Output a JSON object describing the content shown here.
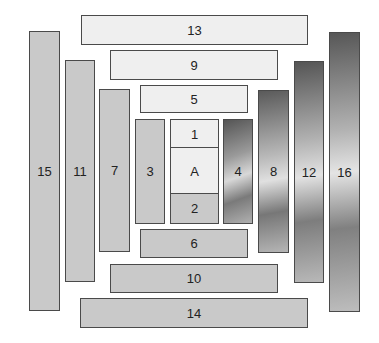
{
  "diagram": {
    "boxes": [
      {
        "id": "13",
        "label": "13"
      },
      {
        "id": "9",
        "label": "9"
      },
      {
        "id": "5",
        "label": "5"
      },
      {
        "id": "15",
        "label": "15"
      },
      {
        "id": "11",
        "label": "11"
      },
      {
        "id": "7",
        "label": "7"
      },
      {
        "id": "3",
        "label": "3"
      },
      {
        "id": "1",
        "label": "1"
      },
      {
        "id": "A",
        "label": "A"
      },
      {
        "id": "2",
        "label": "2"
      },
      {
        "id": "4",
        "label": "4"
      },
      {
        "id": "8",
        "label": "8"
      },
      {
        "id": "12",
        "label": "12"
      },
      {
        "id": "16",
        "label": "16"
      },
      {
        "id": "6",
        "label": "6"
      },
      {
        "id": "10",
        "label": "10"
      },
      {
        "id": "14",
        "label": "14"
      }
    ],
    "colors": {
      "light_fill": "#efefef",
      "mid_fill": "#c9c9c9",
      "border": "#4a4a4a",
      "text": "#222222"
    }
  }
}
